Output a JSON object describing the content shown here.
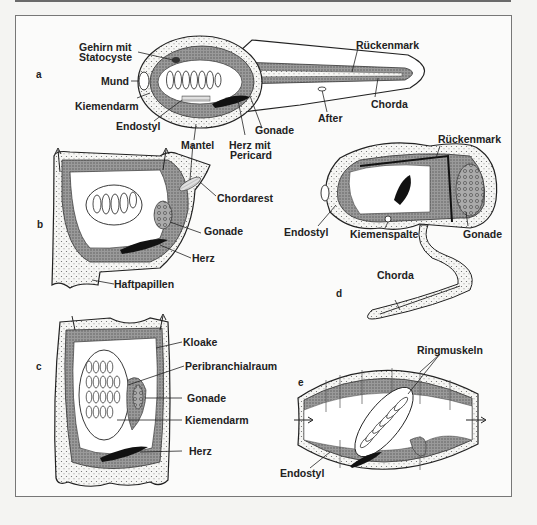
{
  "figure": {
    "panels": {
      "a": {
        "letter": "a",
        "labels": {
          "gehirn": "Gehirn mit",
          "statocyste": "Statocyste",
          "mund": "Mund",
          "kiemendarm": "Kiemendarm",
          "endostyl": "Endostyl",
          "mantel": "Mantel",
          "herz1": "Herz mit",
          "herz2": "Pericard",
          "gonade": "Gonade",
          "after": "After",
          "chorda": "Chorda",
          "rueckenmark": "Rückenmark"
        }
      },
      "b": {
        "letter": "b",
        "labels": {
          "chordarest": "Chordarest",
          "gonade": "Gonade",
          "herz": "Herz",
          "haftpapillen": "Haftpapillen"
        }
      },
      "c": {
        "letter": "c",
        "labels": {
          "kloake": "Kloake",
          "peribranchialraum": "Peribranchialraum",
          "gonade": "Gonade",
          "kiemendarm": "Kiemendarm",
          "herz": "Herz"
        }
      },
      "d": {
        "letter": "d",
        "labels": {
          "rueckenmark": "Rückenmark",
          "endostyl": "Endostyl",
          "kiemenspalte": "Kiemenspalte",
          "gonade": "Gonade",
          "chorda": "Chorda"
        }
      },
      "e": {
        "letter": "e",
        "labels": {
          "ringmuskeln": "Ringmuskeln",
          "endostyl": "Endostyl"
        }
      }
    }
  }
}
